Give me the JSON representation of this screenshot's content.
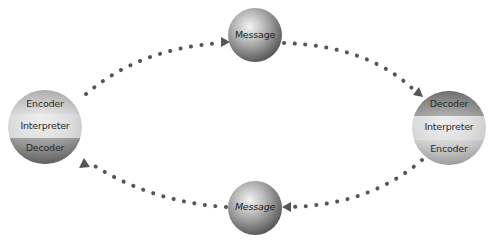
{
  "diagram": {
    "colors": {
      "background": "#ffffff",
      "dots": "#555555",
      "sphere_light": "#f2f2f2",
      "sphere_mid": "#b5b5b5",
      "sphere_dark": "#555555"
    },
    "nodes": [
      {
        "id": "left",
        "role": "communicator",
        "bands": [
          "Encoder",
          "Interpreter",
          "Decoder"
        ]
      },
      {
        "id": "top",
        "role": "message",
        "label": "Message"
      },
      {
        "id": "right",
        "role": "communicator",
        "bands": [
          "Decoder",
          "Interpreter",
          "Encoder"
        ]
      },
      {
        "id": "bottom",
        "role": "message",
        "label": "Message"
      }
    ],
    "edges": [
      {
        "from": "left",
        "to": "top",
        "style": "dotted-arrow"
      },
      {
        "from": "top",
        "to": "right",
        "style": "dotted-arrow"
      },
      {
        "from": "right",
        "to": "bottom",
        "style": "dotted-arrow"
      },
      {
        "from": "bottom",
        "to": "left",
        "style": "dotted-arrow"
      }
    ]
  }
}
